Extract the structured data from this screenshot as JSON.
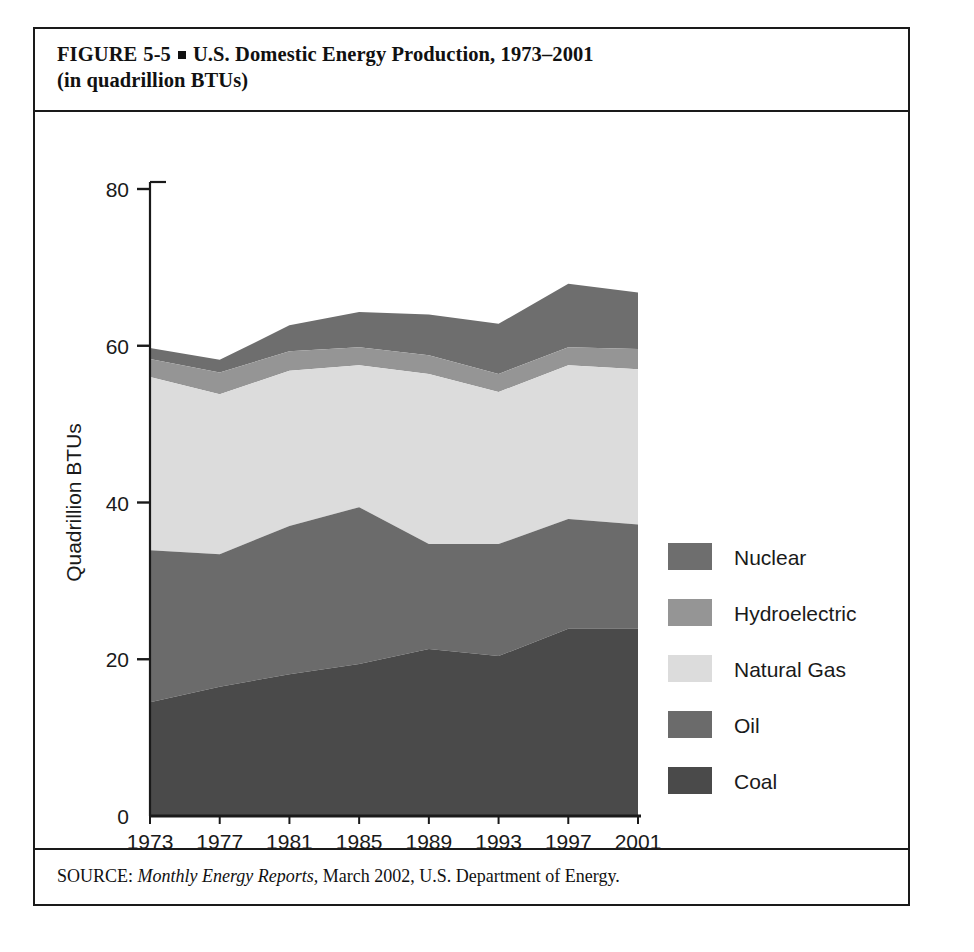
{
  "figure": {
    "label": "FIGURE",
    "number": "5-5",
    "title_line1": "U.S. Domestic Energy Production, 1973–2001",
    "title_line2": "(in quadrillion BTUs)"
  },
  "source": {
    "prefix": "SOURCE:",
    "italic": "Monthly Energy Reports,",
    "rest": "March 2002, U.S. Department of Energy."
  },
  "legend": {
    "position": "right",
    "items": [
      {
        "label": "Nuclear",
        "color": "#6e6e6e"
      },
      {
        "label": "Hydroelectric",
        "color": "#959595"
      },
      {
        "label": "Natural Gas",
        "color": "#dcdcdc"
      },
      {
        "label": "Oil",
        "color": "#6b6b6b"
      },
      {
        "label": "Coal",
        "color": "#4a4a4a"
      }
    ]
  },
  "chart_data": {
    "type": "area",
    "stacked": true,
    "title": "U.S. Domestic Energy Production, 1973–2001 (in quadrillion BTUs)",
    "xlabel": "",
    "ylabel": "Quadrillion BTUs",
    "categories": [
      "1973",
      "1977",
      "1981",
      "1985",
      "1989",
      "1993",
      "1997",
      "2001"
    ],
    "x": [
      1973,
      1977,
      1981,
      1985,
      1989,
      1993,
      1997,
      2001
    ],
    "xlim": [
      1973,
      2001
    ],
    "ylim": [
      0,
      80
    ],
    "yticks": [
      0,
      20,
      40,
      60,
      80
    ],
    "ytick_labels": [
      "0",
      "20",
      "40",
      "60",
      "80"
    ],
    "grid": false,
    "series": [
      {
        "name": "Coal",
        "color": "#4a4a4a",
        "values": [
          14.5,
          16.5,
          18.1,
          19.4,
          21.3,
          20.4,
          23.9,
          23.9
        ]
      },
      {
        "name": "Oil",
        "color": "#6b6b6b",
        "values": [
          19.4,
          16.9,
          18.9,
          20.0,
          13.4,
          14.3,
          14.0,
          13.3
        ]
      },
      {
        "name": "Natural Gas",
        "color": "#dcdcdc",
        "values": [
          22.1,
          20.4,
          19.8,
          18.1,
          21.7,
          19.4,
          19.6,
          19.8
        ]
      },
      {
        "name": "Hydroelectric",
        "color": "#959595",
        "values": [
          2.3,
          2.8,
          2.5,
          2.3,
          2.4,
          2.3,
          2.3,
          2.6
        ]
      },
      {
        "name": "Nuclear",
        "color": "#6e6e6e",
        "values": [
          1.4,
          1.6,
          3.3,
          4.5,
          5.2,
          6.4,
          8.1,
          7.2
        ]
      }
    ],
    "series_order_bottom_to_top": [
      "Coal",
      "Oil",
      "Natural Gas",
      "Hydroelectric",
      "Nuclear"
    ],
    "stack_tops": {
      "Coal": [
        14.5,
        16.5,
        18.1,
        19.4,
        21.3,
        20.4,
        23.9,
        23.9
      ],
      "Oil": [
        33.9,
        33.4,
        37.0,
        39.4,
        34.7,
        34.7,
        37.9,
        37.2
      ],
      "Natural Gas": [
        56.0,
        53.8,
        56.8,
        57.5,
        56.4,
        54.1,
        57.5,
        57.0
      ],
      "Hydroelectric": [
        58.3,
        56.6,
        59.3,
        59.8,
        58.8,
        56.4,
        59.8,
        59.6
      ],
      "Nuclear": [
        59.7,
        58.2,
        62.6,
        64.3,
        64.0,
        62.8,
        67.9,
        66.8
      ]
    },
    "totals": [
      59.7,
      58.2,
      62.6,
      64.3,
      64.0,
      62.8,
      67.9,
      66.8
    ]
  }
}
